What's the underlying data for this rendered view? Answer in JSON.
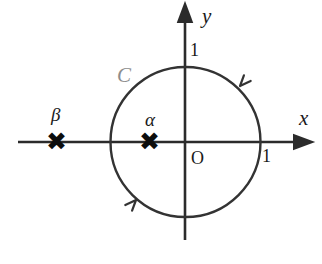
{
  "figure": {
    "background_color": "#ffffff",
    "stroke_color": "#333333",
    "axis_color": "#2b2b2b",
    "marker_color": "#0d0d0d",
    "curve_label_color": "#8d8d8d",
    "width": 322,
    "height": 264
  },
  "axes": {
    "x_axis": {
      "label": "x",
      "label_x": 299,
      "label_y": 108,
      "x_start": 18,
      "x_end": 302,
      "y": 142,
      "arrow": "right"
    },
    "y_axis": {
      "label": "y",
      "label_x": 202,
      "label_y": 6,
      "x": 185,
      "y_start": 240,
      "y_end": 12,
      "arrow": "up"
    },
    "origin": {
      "label": "O",
      "label_x": 191,
      "label_y": 149,
      "x": 185,
      "y": 142
    },
    "ticks": [
      {
        "label": "1",
        "axis": "y",
        "value": 1,
        "label_x": 190,
        "label_y": 41,
        "point_x": 185,
        "point_y": 67
      },
      {
        "label": "1",
        "axis": "x",
        "value": 1,
        "label_x": 262,
        "label_y": 147,
        "point_x": 261,
        "point_y": 142
      }
    ]
  },
  "curve": {
    "name": "C",
    "label": "C",
    "label_x": 117,
    "label_y": 65,
    "center_x": 185.5,
    "center_y": 142,
    "radius": 75,
    "orientation": "counterclockwise",
    "stroke_width": 2.4,
    "direction_arrows": [
      {
        "name": "upper-right-direction-arrow",
        "x": 238,
        "y": 88,
        "angle_deg": 42
      },
      {
        "name": "lower-left-direction-arrow",
        "x": 133,
        "y": 197,
        "angle_deg": 222
      }
    ]
  },
  "points": [
    {
      "name": "alpha",
      "label": "α",
      "marker": "✖",
      "marker_x": 151,
      "marker_y": 141,
      "label_x": 145,
      "label_y": 110,
      "inside_curve": true
    },
    {
      "name": "beta",
      "label": "β",
      "marker": "✖",
      "marker_x": 58,
      "marker_y": 141,
      "label_x": 51,
      "label_y": 105,
      "inside_curve": false
    }
  ]
}
